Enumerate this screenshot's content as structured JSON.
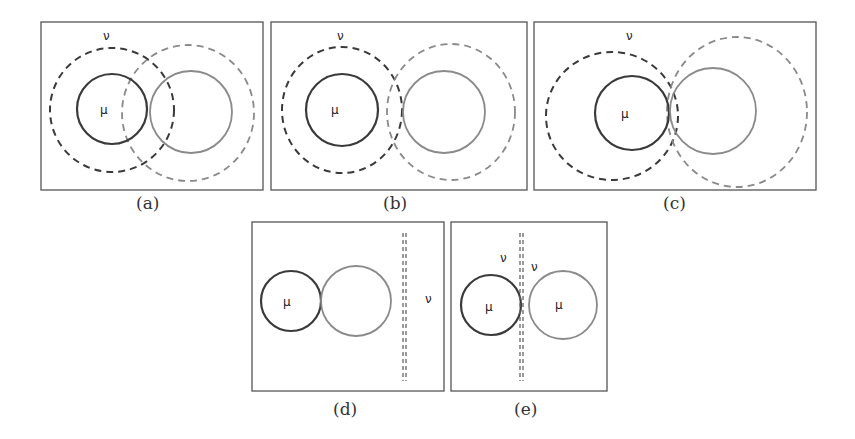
{
  "figure": {
    "colors": {
      "frame": "#555555",
      "mu_circle": "#3a3a3a",
      "other_circle": "#8a8a8a",
      "nu_dashed_dark": "#3a3a3a",
      "nu_dashed_light": "#8a8a8a"
    },
    "panels": [
      {
        "id": "a",
        "caption": "(a)",
        "labels": {
          "mu": "μ",
          "nu": "ν"
        },
        "description": "Two solid circles (dark mu, light grey) touching; dashed nu regions around each overlap substantially"
      },
      {
        "id": "b",
        "caption": "(b)",
        "labels": {
          "mu": "μ",
          "nu": "ν"
        },
        "description": "Two solid circles separated slightly; dashed nu regions touch / overlap slightly"
      },
      {
        "id": "c",
        "caption": "(c)",
        "labels": {
          "mu": "μ",
          "nu": "ν"
        },
        "description": "Two solid circles touching; dashed nu regions meet at the tangent point"
      },
      {
        "id": "d",
        "caption": "(d)",
        "labels": {
          "mu": "μ",
          "nu": "ν"
        },
        "description": "Two touching solid circles; nu is a vertical dashed line to the right"
      },
      {
        "id": "e",
        "caption": "(e)",
        "labels": {
          "mu_left": "μ",
          "mu_right": "μ",
          "nu_left": "ν",
          "nu_right": "ν"
        },
        "description": "Two solid circles separated by a vertical dashed line; nu labels on each side"
      }
    ]
  }
}
